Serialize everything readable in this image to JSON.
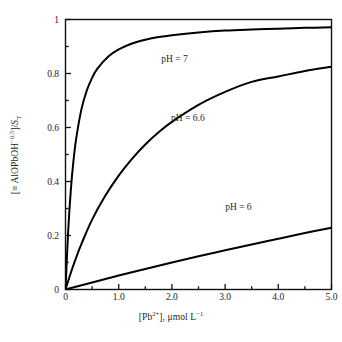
{
  "chart_data": {
    "type": "line",
    "title": "",
    "subtitle": "",
    "xlabel": "[Pb2+], umol L-1",
    "xlabel_display": "[Pb²⁺], μmol L⁻¹",
    "ylabel": "[=AlOPbOH-0.5]/ST",
    "ylabel_display": "[≡AlOPbOH⁻⁰·⁵]/S_T",
    "xlim": [
      0,
      5.0
    ],
    "ylim": [
      0,
      1
    ],
    "grid": false,
    "legend_position": "inline-annotations",
    "xticks": [
      0,
      1.0,
      2.0,
      3.0,
      4.0,
      5.0
    ],
    "xtick_labels": [
      "0",
      "1.0",
      "2.0",
      "3.0",
      "4.0",
      "5.0"
    ],
    "yticks": [
      0,
      0.2,
      0.4,
      0.6,
      0.8,
      1
    ],
    "ytick_labels": [
      "0",
      "0.2",
      "0.4",
      "0.6",
      "0.8",
      "1"
    ],
    "xminor_ticks": [
      0.5,
      1.5,
      2.5,
      3.5,
      4.5
    ],
    "yminor_ticks": [
      0.1,
      0.3,
      0.5,
      0.7,
      0.9
    ],
    "line_color": "#000000",
    "line_width": 2.0,
    "series": [
      {
        "name": "pH = 7",
        "label": "pH = 7",
        "x": [
          0,
          0.05,
          0.1,
          0.15,
          0.2,
          0.3,
          0.4,
          0.5,
          0.6,
          0.8,
          1.0,
          1.25,
          1.5,
          1.75,
          2.0,
          2.5,
          3.0,
          3.5,
          4.0,
          4.5,
          5.0
        ],
        "values": [
          0,
          0.215,
          0.368,
          0.477,
          0.558,
          0.668,
          0.737,
          0.784,
          0.818,
          0.862,
          0.889,
          0.911,
          0.925,
          0.935,
          0.942,
          0.952,
          0.959,
          0.963,
          0.966,
          0.969,
          0.971
        ]
      },
      {
        "name": "pH = 6.6",
        "label": "pH = 6.6",
        "x": [
          0,
          0.1,
          0.2,
          0.3,
          0.5,
          0.75,
          1.0,
          1.25,
          1.5,
          1.75,
          2.0,
          2.5,
          3.0,
          3.5,
          4.0,
          4.5,
          5.0
        ],
        "values": [
          0,
          0.062,
          0.118,
          0.169,
          0.259,
          0.348,
          0.422,
          0.484,
          0.537,
          0.582,
          0.621,
          0.684,
          0.732,
          0.769,
          0.789,
          0.809,
          0.825
        ]
      },
      {
        "name": "pH = 6",
        "label": "pH = 6",
        "x": [
          0,
          0.25,
          0.5,
          0.75,
          1.0,
          1.5,
          2.0,
          2.5,
          3.0,
          3.5,
          4.0,
          4.5,
          5.0
        ],
        "values": [
          0,
          0.013,
          0.026,
          0.039,
          0.052,
          0.076,
          0.1,
          0.123,
          0.145,
          0.167,
          0.188,
          0.209,
          0.229
        ]
      }
    ],
    "annotations": [
      {
        "text": "pH = 7",
        "x": 2.05,
        "y": 0.855
      },
      {
        "text": "pH = 6.6",
        "x": 2.3,
        "y": 0.635
      },
      {
        "text": "pH = 6",
        "x": 3.25,
        "y": 0.305
      }
    ]
  }
}
